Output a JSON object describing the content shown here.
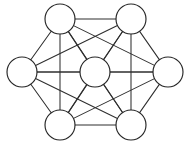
{
  "figure": {
    "background_color": "#ffffff",
    "width": 189,
    "height": 147
  },
  "chart_data": {
    "type": "diagram",
    "diagram_kind": "graph",
    "node_count": 7,
    "edge_count": 21,
    "node_radius": 15,
    "node_fill": "#ffffff",
    "node_stroke": "#262626",
    "edge_color": "#2e2e2e",
    "edge_width": 1.05,
    "directed": false,
    "nodes": [
      {
        "id": "top-left",
        "label": "",
        "x": 60,
        "y": 19,
        "r": 15,
        "degree": 6
      },
      {
        "id": "top-right",
        "label": "",
        "x": 131,
        "y": 19,
        "r": 15,
        "degree": 6
      },
      {
        "id": "right",
        "label": "",
        "x": 168,
        "y": 72,
        "r": 15,
        "degree": 6
      },
      {
        "id": "bottom-right",
        "label": "",
        "x": 131,
        "y": 125,
        "r": 15,
        "degree": 6
      },
      {
        "id": "bottom-left",
        "label": "",
        "x": 60,
        "y": 125,
        "r": 15,
        "degree": 6
      },
      {
        "id": "left",
        "label": "",
        "x": 22,
        "y": 72,
        "r": 15,
        "degree": 6
      },
      {
        "id": "center",
        "label": "",
        "x": 95,
        "y": 72,
        "r": 15,
        "degree": 6
      }
    ],
    "edges": [
      {
        "from": "top-left",
        "to": "top-right"
      },
      {
        "from": "top-left",
        "to": "right"
      },
      {
        "from": "top-left",
        "to": "bottom-right"
      },
      {
        "from": "top-left",
        "to": "bottom-left"
      },
      {
        "from": "top-left",
        "to": "left"
      },
      {
        "from": "top-left",
        "to": "center"
      },
      {
        "from": "top-right",
        "to": "right"
      },
      {
        "from": "top-right",
        "to": "bottom-right"
      },
      {
        "from": "top-right",
        "to": "bottom-left"
      },
      {
        "from": "top-right",
        "to": "left"
      },
      {
        "from": "top-right",
        "to": "center"
      },
      {
        "from": "right",
        "to": "bottom-right"
      },
      {
        "from": "right",
        "to": "bottom-left"
      },
      {
        "from": "right",
        "to": "left"
      },
      {
        "from": "right",
        "to": "center"
      },
      {
        "from": "bottom-right",
        "to": "bottom-left"
      },
      {
        "from": "bottom-right",
        "to": "left"
      },
      {
        "from": "bottom-right",
        "to": "center"
      },
      {
        "from": "bottom-left",
        "to": "left"
      },
      {
        "from": "bottom-left",
        "to": "center"
      },
      {
        "from": "left",
        "to": "center"
      }
    ]
  }
}
